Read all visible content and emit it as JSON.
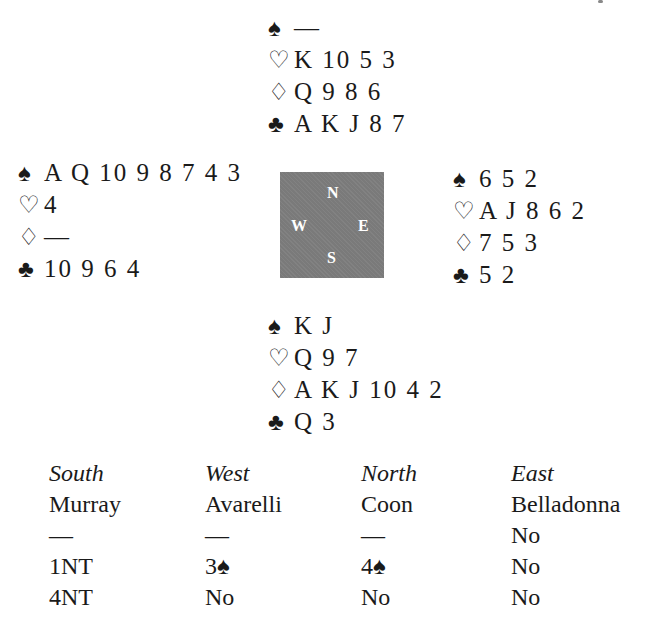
{
  "suits": {
    "spades": "♠",
    "hearts": "♡",
    "diamonds": "♢",
    "clubs": "♣"
  },
  "hands": {
    "north": {
      "spades": "—",
      "hearts": "K 10 5 3",
      "diamonds": "Q 9 8 6",
      "clubs": "A K J 8 7"
    },
    "west": {
      "spades": "A Q 10 9 8 7 4 3",
      "hearts": "4",
      "diamonds": "—",
      "clubs": "10 9 6 4"
    },
    "east": {
      "spades": "6 5 2",
      "hearts": "A J 8 6 2",
      "diamonds": "7 5 3",
      "clubs": "5 2"
    },
    "south": {
      "spades": "K J",
      "hearts": "Q 9 7",
      "diamonds": "A K J 10 4 2",
      "clubs": "Q 3"
    }
  },
  "compass": {
    "north": "N",
    "west": "W",
    "east": "E",
    "south": "S"
  },
  "auction": {
    "seats": [
      "South",
      "West",
      "North",
      "East"
    ],
    "players": [
      "Murray",
      "Avarelli",
      "Coon",
      "Belladonna"
    ],
    "rounds": [
      [
        "—",
        "—",
        "—",
        "No"
      ],
      [
        "1NT",
        "3♠",
        "4♠",
        "No"
      ],
      [
        "4NT",
        "No",
        "No",
        "No"
      ]
    ]
  }
}
